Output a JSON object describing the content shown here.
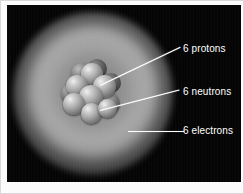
{
  "figure": {
    "background_color": "#050505",
    "frame_color": "#fbfbfb",
    "label_color": "#ffffff",
    "leader_color": "#ffffff"
  },
  "annotations": [
    {
      "id": "protons",
      "label": "6 protons",
      "count": 6,
      "particle": "protons",
      "target": "nucleus"
    },
    {
      "id": "neutrons",
      "label": "6 neutrons",
      "count": 6,
      "particle": "neutrons",
      "target": "nucleus"
    },
    {
      "id": "electrons",
      "label": "6 electrons",
      "count": 6,
      "particle": "electrons",
      "target": "electron-cloud"
    }
  ],
  "parts": {
    "electron_cloud_name": "electron-cloud",
    "nucleus_name": "nucleus"
  }
}
